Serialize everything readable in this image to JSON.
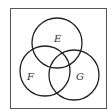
{
  "diagram": {
    "type": "venn",
    "universe_box": {
      "x": 10,
      "y": 8,
      "width": 96,
      "height": 100
    },
    "sets": [
      {
        "label": "E",
        "cx": 57,
        "cy": 43,
        "r": 25
      },
      {
        "label": "F",
        "cx": 45,
        "cy": 71,
        "r": 25
      },
      {
        "label": "G",
        "cx": 74,
        "cy": 75,
        "r": 25
      }
    ],
    "colors": {
      "stroke": "#222222",
      "label": "#333333",
      "background": "#ffffff"
    }
  }
}
